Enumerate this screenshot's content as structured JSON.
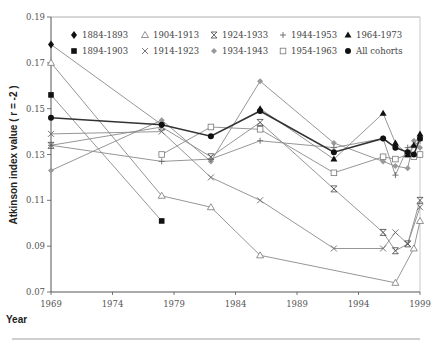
{
  "chart_data": {
    "type": "line",
    "title": "",
    "xlabel": "Year",
    "ylabel": "Atkinson index value ( r = -2 )",
    "xlim": [
      1969,
      1999
    ],
    "ylim": [
      0.07,
      0.19
    ],
    "x_ticks": [
      "1969",
      "1974",
      "1979",
      "1984",
      "1989",
      "1994",
      "1999"
    ],
    "y_ticks": [
      "0.07",
      "0.09",
      "0.11",
      "0.13",
      "0.15",
      "0.17",
      "0.19"
    ],
    "grid": false,
    "legend_position": "top, inside plot, 2 rows x 5 columns",
    "x": [
      1969,
      1978,
      1982,
      1986,
      1992,
      1996,
      1997,
      1998,
      1998.5,
      1999
    ],
    "series": [
      {
        "name": "1884-1893",
        "marker": "diamond-filled",
        "color": "#222222",
        "points": [
          [
            1969,
            0.178
          ],
          [
            1978,
            0.143
          ]
        ]
      },
      {
        "name": "1894-1903",
        "marker": "square-filled",
        "color": "#222222",
        "points": [
          [
            1969,
            0.156
          ],
          [
            1978,
            0.101
          ]
        ]
      },
      {
        "name": "1904-1913",
        "marker": "triangle-open",
        "color": "#777777",
        "points": [
          [
            1969,
            0.17
          ],
          [
            1978,
            0.112
          ],
          [
            1982,
            0.107
          ],
          [
            1986,
            0.086
          ],
          [
            1997,
            0.074
          ],
          [
            1998.5,
            0.089
          ],
          [
            1999,
            0.101
          ]
        ]
      },
      {
        "name": "1914-1923",
        "marker": "x",
        "color": "#777777",
        "points": [
          [
            1969,
            0.139
          ],
          [
            1978,
            0.14
          ],
          [
            1982,
            0.12
          ],
          [
            1986,
            0.11
          ],
          [
            1992,
            0.089
          ],
          [
            1996,
            0.089
          ],
          [
            1997,
            0.096
          ],
          [
            1998,
            0.091
          ],
          [
            1999,
            0.107
          ]
        ]
      },
      {
        "name": "1924-1933",
        "marker": "asterisk",
        "color": "#555555",
        "points": [
          [
            1969,
            0.134
          ],
          [
            1978,
            0.142
          ],
          [
            1982,
            0.129
          ],
          [
            1986,
            0.144
          ],
          [
            1992,
            0.115
          ],
          [
            1996,
            0.096
          ],
          [
            1997,
            0.088
          ],
          [
            1998,
            0.091
          ],
          [
            1999,
            0.11
          ]
        ]
      },
      {
        "name": "1934-1943",
        "marker": "diamond-gray",
        "color": "#999999",
        "points": [
          [
            1969,
            0.123
          ],
          [
            1978,
            0.145
          ],
          [
            1982,
            0.127
          ],
          [
            1986,
            0.162
          ],
          [
            1992,
            0.135
          ],
          [
            1996,
            0.127
          ],
          [
            1997,
            0.125
          ],
          [
            1998,
            0.124
          ],
          [
            1998.5,
            0.136
          ],
          [
            1999,
            0.133
          ]
        ]
      },
      {
        "name": "1944-1953",
        "marker": "plus",
        "color": "#777777",
        "points": [
          [
            1969,
            0.134
          ],
          [
            1978,
            0.127
          ],
          [
            1982,
            0.128
          ],
          [
            1986,
            0.136
          ],
          [
            1992,
            0.133
          ],
          [
            1996,
            0.137
          ],
          [
            1997,
            0.121
          ],
          [
            1998,
            0.133
          ],
          [
            1998.5,
            0.134
          ],
          [
            1999,
            0.136
          ]
        ]
      },
      {
        "name": "1954-1963",
        "marker": "square-open",
        "color": "#888888",
        "points": [
          [
            1978,
            0.13
          ],
          [
            1982,
            0.142
          ],
          [
            1986,
            0.141
          ],
          [
            1992,
            0.122
          ],
          [
            1996,
            0.129
          ],
          [
            1997,
            0.128
          ],
          [
            1998,
            0.13
          ],
          [
            1998.5,
            0.129
          ],
          [
            1999,
            0.13
          ]
        ]
      },
      {
        "name": "1964-1973",
        "marker": "triangle-filled",
        "color": "#333333",
        "points": [
          [
            1986,
            0.15
          ],
          [
            1992,
            0.128
          ],
          [
            1996,
            0.148
          ],
          [
            1997,
            0.135
          ],
          [
            1998,
            0.13
          ],
          [
            1998.5,
            0.134
          ],
          [
            1999,
            0.139
          ]
        ]
      },
      {
        "name": "All cohorts",
        "marker": "circle-filled",
        "color": "#222222",
        "bold": true,
        "points": [
          [
            1969,
            0.146
          ],
          [
            1978,
            0.143
          ],
          [
            1982,
            0.138
          ],
          [
            1986,
            0.149
          ],
          [
            1992,
            0.131
          ],
          [
            1996,
            0.137
          ],
          [
            1997,
            0.133
          ],
          [
            1998,
            0.131
          ],
          [
            1998.5,
            0.13
          ],
          [
            1999,
            0.137
          ]
        ]
      }
    ]
  },
  "legend": {
    "items": [
      {
        "label": "1884-1893",
        "marker": "diamond-filled"
      },
      {
        "label": "1904-1913",
        "marker": "triangle-open"
      },
      {
        "label": "1924-1933",
        "marker": "asterisk"
      },
      {
        "label": "1944-1953",
        "marker": "plus"
      },
      {
        "label": "1964-1973",
        "marker": "triangle-filled"
      },
      {
        "label": "1894-1903",
        "marker": "square-filled"
      },
      {
        "label": "1914-1923",
        "marker": "x"
      },
      {
        "label": "1934-1943",
        "marker": "diamond-gray"
      },
      {
        "label": "1954-1963",
        "marker": "square-open"
      },
      {
        "label": "All cohorts",
        "marker": "circle-filled"
      }
    ]
  },
  "axes": {
    "x_title": "Year",
    "y_title": "Atkinson index value ( r = -2 )"
  }
}
